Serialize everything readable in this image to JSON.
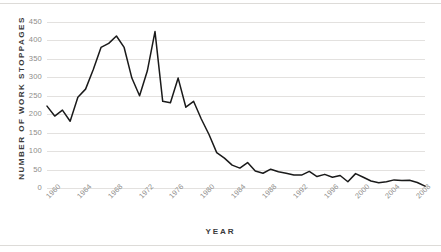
{
  "chart_data": {
    "type": "line",
    "title": "",
    "xlabel": "YEAR",
    "ylabel": "NUMBER OF WORK STOPPAGES",
    "ylim": [
      0,
      465
    ],
    "xlim": [
      1960,
      2009
    ],
    "grid": "horizontal",
    "legend": "none",
    "line_color": "#1a1a1a",
    "grid_color": "#e3e1df",
    "tick_color": "#8e8c8a",
    "label_color": "#3a3a3a",
    "yticks": [
      0,
      50,
      100,
      150,
      200,
      250,
      300,
      350,
      400,
      450
    ],
    "ytick_labels": [
      "0",
      "50",
      "100",
      "150",
      "200",
      "250",
      "300",
      "350",
      "400",
      "450"
    ],
    "xticks": [
      1960,
      1964,
      1968,
      1972,
      1976,
      1980,
      1984,
      1988,
      1992,
      1996,
      2000,
      2004,
      2008
    ],
    "xtick_labels": [
      "1960",
      "1964",
      "1968",
      "1972",
      "1976",
      "1980",
      "1984",
      "1988",
      "1992",
      "1996",
      "2000",
      "2004",
      "2008"
    ],
    "x": [
      1960,
      1961,
      1962,
      1963,
      1964,
      1965,
      1966,
      1967,
      1968,
      1969,
      1970,
      1971,
      1972,
      1973,
      1974,
      1975,
      1976,
      1977,
      1978,
      1979,
      1980,
      1981,
      1982,
      1983,
      1984,
      1985,
      1986,
      1987,
      1988,
      1989,
      1990,
      1991,
      1992,
      1993,
      1994,
      1995,
      1996,
      1997,
      1998,
      1999,
      2000,
      2001,
      2002,
      2003,
      2004,
      2005,
      2006,
      2007,
      2008,
      2009
    ],
    "values": [
      222,
      195,
      211,
      181,
      246,
      268,
      321,
      381,
      392,
      412,
      381,
      298,
      250,
      317,
      424,
      235,
      231,
      298,
      219,
      235,
      187,
      145,
      96,
      81,
      62,
      54,
      69,
      46,
      40,
      51,
      44,
      40,
      35,
      35,
      45,
      31,
      37,
      29,
      34,
      17,
      39,
      29,
      19,
      14,
      17,
      22,
      20,
      21,
      15,
      5
    ]
  }
}
